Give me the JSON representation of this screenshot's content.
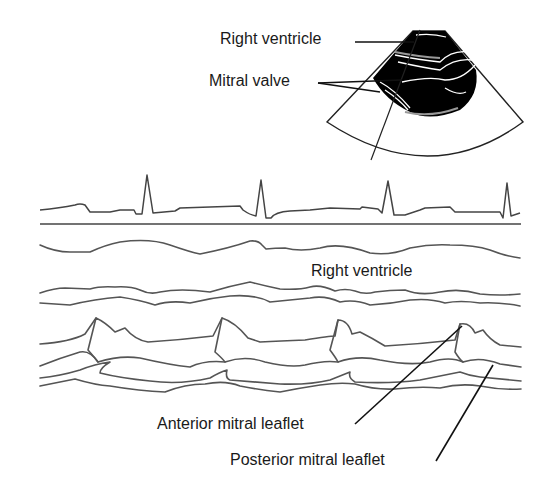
{
  "diagram": {
    "inset": {
      "type": "2D sector scan",
      "labels": {
        "right_ventricle": "Right ventricle",
        "mitral_valve": "Mitral valve"
      }
    },
    "mmode": {
      "labels": {
        "right_ventricle": "Right ventricle",
        "anterior_leaflet": "Anterior mitral leaflet",
        "posterior_leaflet": "Posterior mitral leaflet"
      },
      "traces": [
        "ECG",
        "Right ventricle wall",
        "Septum",
        "Anterior mitral leaflet",
        "Posterior mitral leaflet"
      ],
      "beats": 4
    },
    "colors": {
      "trace": "#555555",
      "text": "#1a1a1a",
      "sector_fill": "#000000"
    }
  }
}
